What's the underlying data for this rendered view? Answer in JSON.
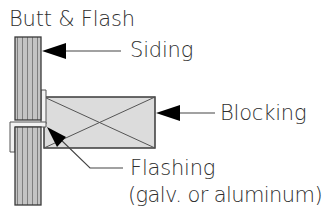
{
  "diagram": {
    "title": "Butt & Flash",
    "labels": {
      "siding": "Siding",
      "blocking": "Blocking",
      "flashing": "Flashing",
      "flashing_note": "(galv. or aluminum)"
    },
    "components": [
      {
        "name": "upper siding board",
        "type": "vertical-grain board"
      },
      {
        "name": "lower siding board",
        "type": "vertical-grain board"
      },
      {
        "name": "blocking",
        "type": "rectangle with X (cross-section)"
      },
      {
        "name": "flashing",
        "type": "Z-shaped metal strip at butt joint"
      }
    ],
    "colors": {
      "stroke": "#333333",
      "siding_fill": "#bdbdbd",
      "siding_grain": "#8a8a8a",
      "blocking_fill": "#dcdcdc",
      "flashing_fill": "#f2f2f2",
      "text": "#2e2e2e"
    }
  }
}
